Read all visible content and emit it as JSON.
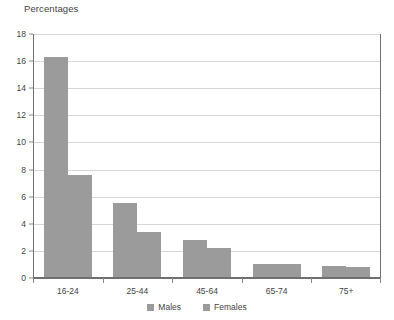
{
  "chart_data": {
    "type": "bar",
    "title": "Percentages",
    "xlabel": "",
    "ylabel": "",
    "ylim": [
      0,
      18
    ],
    "yticks": [
      0,
      2,
      4,
      6,
      8,
      10,
      12,
      14,
      16,
      18
    ],
    "grid": true,
    "legend_position": "bottom-center",
    "categories": [
      "16-24",
      "25-44",
      "45-64",
      "65-74",
      "75+"
    ],
    "series": [
      {
        "name": "Males",
        "values": [
          16.3,
          5.5,
          2.8,
          1.0,
          0.9
        ],
        "color": "#9b9b9b"
      },
      {
        "name": "Females",
        "values": [
          7.6,
          3.4,
          2.2,
          1.0,
          0.8
        ],
        "color": "#9b9b9b"
      }
    ]
  },
  "legend": {
    "items": [
      {
        "label": "Males"
      },
      {
        "label": "Females"
      }
    ]
  },
  "colors": {
    "bar": "#9b9b9b",
    "gridline": "#d6d6d6",
    "axis": "#6f6f6f",
    "text": "#3f3f3f",
    "background": "#ffffff"
  }
}
